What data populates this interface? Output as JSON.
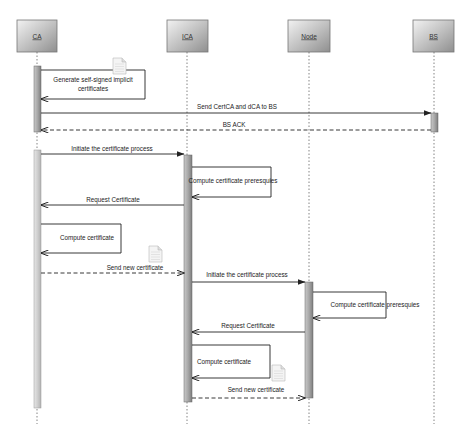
{
  "diagram": {
    "type": "sequence",
    "participants": [
      {
        "id": "CA",
        "label": "CA",
        "x": 37
      },
      {
        "id": "ICA",
        "label": "ICA",
        "x": 187
      },
      {
        "id": "Node",
        "label": "Node",
        "x": 309
      },
      {
        "id": "BS",
        "label": "BS",
        "x": 434
      }
    ],
    "messages": [
      {
        "from": "CA",
        "to": "CA",
        "kind": "self",
        "label_line1": "Generate self-signed implicit",
        "label_line2": "certificates",
        "note_icon": "document-icon"
      },
      {
        "from": "CA",
        "to": "BS",
        "kind": "sync",
        "label": "Send CertCA and dCA  to BS"
      },
      {
        "from": "BS",
        "to": "CA",
        "kind": "reply",
        "label": "BS ACK"
      },
      {
        "from": "CA",
        "to": "ICA",
        "kind": "sync",
        "label": "Initiate the certificate process"
      },
      {
        "from": "ICA",
        "to": "ICA",
        "kind": "self",
        "label": "Compute certificate preresquies"
      },
      {
        "from": "ICA",
        "to": "CA",
        "kind": "sync",
        "label": "Request Certificate"
      },
      {
        "from": "CA",
        "to": "CA",
        "kind": "self",
        "label": "Compute  certificate"
      },
      {
        "from": "CA",
        "to": "ICA",
        "kind": "reply",
        "label": "Send new certificate",
        "note_icon": "document-icon"
      },
      {
        "from": "ICA",
        "to": "Node",
        "kind": "sync",
        "label": "Initiate the certificate process"
      },
      {
        "from": "Node",
        "to": "Node",
        "kind": "self",
        "label": "Compute certificate preresquies"
      },
      {
        "from": "Node",
        "to": "ICA",
        "kind": "sync",
        "label": "Request Certificate"
      },
      {
        "from": "ICA",
        "to": "ICA",
        "kind": "self",
        "label": "Compute certificate"
      },
      {
        "from": "ICA",
        "to": "Node",
        "kind": "reply",
        "label": "Send new certificate",
        "note_icon": "document-icon"
      }
    ]
  },
  "labels": {
    "p_ca": "CA",
    "p_ica": "ICA",
    "p_node": "Node",
    "p_bs": "BS",
    "m1a": "Generate self-signed implicit",
    "m1b": "certificates",
    "m2": "Send CertCA and dCA  to BS",
    "m3": "BS ACK",
    "m4": "Initiate the certificate process",
    "m5": "Compute certificate preresquies",
    "m6": "Request Certificate",
    "m7": "Compute  certificate",
    "m8": "Send new certificate",
    "m9": "Initiate the certificate process",
    "m10": "Compute certificate preresquies",
    "m11": "Request Certificate",
    "m12": "Compute certificate",
    "m13": "Send new certificate"
  },
  "colors": {
    "line": "#222222",
    "lifeline": "#555555",
    "activation_light": "#d8d8d8",
    "activation_dark": "#8a8a8a"
  }
}
